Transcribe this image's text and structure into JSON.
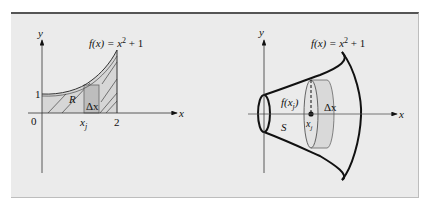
{
  "figure": {
    "left_panel": {
      "function_label": "f(x) = x² + 1",
      "function_label_parts": {
        "fx": "f(x) = x",
        "sup": "2",
        "rest": " + 1"
      },
      "y_axis_label": "y",
      "x_axis_label": "x",
      "origin_label": "0",
      "y_tick_label": "1",
      "x_tick_label": "2",
      "xj_label": "x",
      "xj_sub": "j",
      "region_label": "R",
      "delta_label": "Δx"
    },
    "right_panel": {
      "function_label_parts": {
        "fx": "f(x) = x",
        "sup": "2",
        "rest": " + 1"
      },
      "y_axis_label": "y",
      "x_axis_label": "x",
      "radius_label": "f(x",
      "radius_sub": "j",
      "radius_close": ")",
      "surface_label": "S",
      "xj_label": "x",
      "xj_sub": "j",
      "delta_label": "Δx"
    },
    "colors": {
      "panel_bg": "#ebebeb",
      "region_fill": "#d6d6d6",
      "rect_fill": "#bdbdbd",
      "disk_fill": "#d9d9d9",
      "stroke": "#111111"
    }
  }
}
